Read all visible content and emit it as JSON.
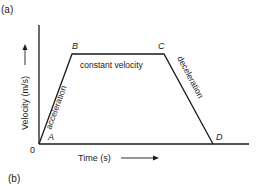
{
  "panel_labels": {
    "top": "(a)",
    "bottom": "(b)"
  },
  "axes": {
    "y_label": "Velocity (m/s)",
    "x_label": "Time (s)",
    "origin_label": "0"
  },
  "points": [
    {
      "name": "A",
      "x": 39,
      "y": 144
    },
    {
      "name": "B",
      "x": 72,
      "y": 54
    },
    {
      "name": "C",
      "x": 164,
      "y": 54
    },
    {
      "name": "D",
      "x": 213,
      "y": 144
    }
  ],
  "segments": {
    "AB": "acceleration",
    "BC": "constant velocity",
    "CD": "deceleration"
  },
  "colors": {
    "line": "#1a1a1a",
    "background": "#ffffff"
  }
}
